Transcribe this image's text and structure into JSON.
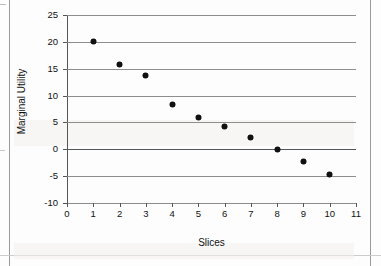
{
  "chart_data": {
    "type": "scatter",
    "title": "",
    "xlabel": "Slices",
    "ylabel": "Marginal Utility",
    "x": [
      1,
      2,
      3,
      4,
      5,
      6,
      7,
      8,
      9,
      10
    ],
    "values": [
      20,
      15.7,
      13.8,
      8.3,
      5.9,
      4.2,
      2.2,
      0,
      -2.3,
      -4.7
    ],
    "series": [
      {
        "name": "Marginal Utility",
        "values": [
          20,
          15.7,
          13.8,
          8.3,
          5.9,
          4.2,
          2.2,
          0,
          -2.3,
          -4.7
        ]
      }
    ],
    "xlim": [
      0,
      11
    ],
    "ylim": [
      -10,
      25
    ],
    "xticks": [
      "0",
      "1",
      "2",
      "3",
      "4",
      "5",
      "6",
      "7",
      "8",
      "9",
      "10",
      "11"
    ],
    "yticks": [
      "25",
      "20",
      "15",
      "10",
      "5",
      "0",
      "-5",
      "-10"
    ],
    "grid": "horizontal",
    "legend": "none",
    "marker_color": "#111111",
    "gridline_color": "#8d8d8d",
    "axis_color": "#555555",
    "background_color": "#ffffff"
  }
}
